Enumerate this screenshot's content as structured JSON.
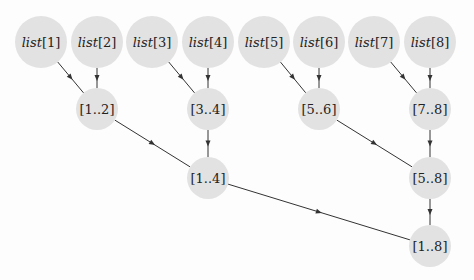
{
  "diagram": {
    "type": "merge-tree",
    "node_color": "#e2e2e2",
    "edge_color": "#333333",
    "nodes": [
      {
        "id": "l1",
        "label_italic": "list",
        "label_rest": "[1]",
        "x": 41,
        "y": 42,
        "r": 26
      },
      {
        "id": "l2",
        "label_italic": "list",
        "label_rest": "[2]",
        "x": 97,
        "y": 42,
        "r": 26
      },
      {
        "id": "l3",
        "label_italic": "list",
        "label_rest": "[3]",
        "x": 152,
        "y": 42,
        "r": 26
      },
      {
        "id": "l4",
        "label_italic": "list",
        "label_rest": "[4]",
        "x": 208,
        "y": 42,
        "r": 26
      },
      {
        "id": "l5",
        "label_italic": "list",
        "label_rest": "[5]",
        "x": 264,
        "y": 42,
        "r": 26
      },
      {
        "id": "l6",
        "label_italic": "list",
        "label_rest": "[6]",
        "x": 319,
        "y": 42,
        "r": 26
      },
      {
        "id": "l7",
        "label_italic": "list",
        "label_rest": "[7]",
        "x": 374,
        "y": 42,
        "r": 26
      },
      {
        "id": "l8",
        "label_italic": "list",
        "label_rest": "[8]",
        "x": 430,
        "y": 42,
        "r": 26
      },
      {
        "id": "m12",
        "label_italic": "",
        "label_rest": "[1..2]",
        "x": 97,
        "y": 109,
        "r": 21
      },
      {
        "id": "m34",
        "label_italic": "",
        "label_rest": "[3..4]",
        "x": 208,
        "y": 109,
        "r": 21
      },
      {
        "id": "m56",
        "label_italic": "",
        "label_rest": "[5..6]",
        "x": 319,
        "y": 109,
        "r": 21
      },
      {
        "id": "m78",
        "label_italic": "",
        "label_rest": "[7..8]",
        "x": 430,
        "y": 109,
        "r": 21
      },
      {
        "id": "m14",
        "label_italic": "",
        "label_rest": "[1..4]",
        "x": 208,
        "y": 178,
        "r": 21
      },
      {
        "id": "m58",
        "label_italic": "",
        "label_rest": "[5..8]",
        "x": 430,
        "y": 178,
        "r": 21
      },
      {
        "id": "m18",
        "label_italic": "",
        "label_rest": "[1..8]",
        "x": 430,
        "y": 246,
        "r": 21
      }
    ],
    "edges": [
      [
        "l1",
        "m12"
      ],
      [
        "l2",
        "m12"
      ],
      [
        "l3",
        "m34"
      ],
      [
        "l4",
        "m34"
      ],
      [
        "l5",
        "m56"
      ],
      [
        "l6",
        "m56"
      ],
      [
        "l7",
        "m78"
      ],
      [
        "l8",
        "m78"
      ],
      [
        "m12",
        "m14"
      ],
      [
        "m34",
        "m14"
      ],
      [
        "m56",
        "m58"
      ],
      [
        "m78",
        "m58"
      ],
      [
        "m14",
        "m18"
      ],
      [
        "m58",
        "m18"
      ]
    ]
  }
}
